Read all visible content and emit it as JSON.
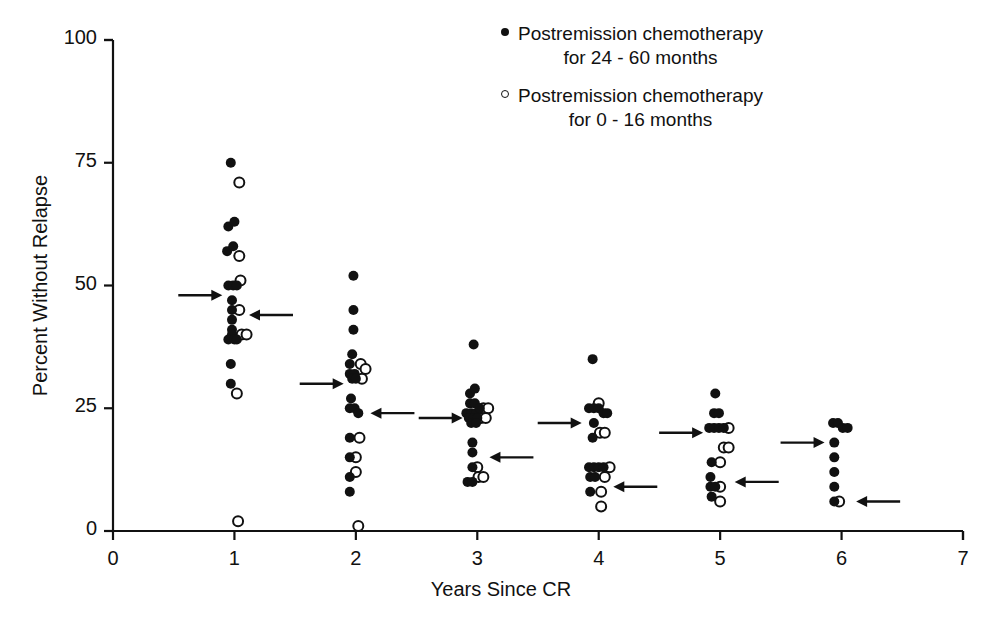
{
  "figure": {
    "title": "",
    "x_axis_label": "Years Since CR",
    "y_axis_label": "Percent Without Relapse",
    "legend": [
      {
        "marker": "filled-circle",
        "line1": "Postremission chemotherapy",
        "line2": "for 24 - 60 months"
      },
      {
        "marker": "open-circle",
        "line1": "Postremission chemotherapy",
        "line2": "for 0 - 16 months"
      }
    ],
    "colors": {
      "ink": "#111111",
      "background": "#ffffff"
    }
  },
  "chart_data": {
    "type": "scatter",
    "title": "",
    "xlabel": "Years Since CR",
    "ylabel": "Percent Without Relapse",
    "xlim": [
      0,
      7
    ],
    "ylim": [
      0,
      100
    ],
    "xticks": [
      0,
      1,
      2,
      3,
      4,
      5,
      6,
      7
    ],
    "yticks": [
      0,
      25,
      50,
      75,
      100
    ],
    "grid": false,
    "legend_position": "top-right",
    "series": [
      {
        "name": "Postremission chemotherapy for 24 - 60 months",
        "marker": "filled-circle",
        "points": [
          [
            0.97,
            75
          ],
          [
            0.95,
            62
          ],
          [
            1.0,
            63
          ],
          [
            0.94,
            57
          ],
          [
            0.99,
            58
          ],
          [
            0.95,
            50
          ],
          [
            0.99,
            50
          ],
          [
            1.02,
            50
          ],
          [
            0.98,
            47
          ],
          [
            0.98,
            45
          ],
          [
            0.98,
            43
          ],
          [
            0.98,
            41
          ],
          [
            0.98,
            40
          ],
          [
            0.95,
            39
          ],
          [
            1.0,
            39
          ],
          [
            1.02,
            39
          ],
          [
            0.97,
            34
          ],
          [
            0.97,
            30
          ],
          [
            1.98,
            52
          ],
          [
            1.98,
            45
          ],
          [
            1.98,
            41
          ],
          [
            1.97,
            36
          ],
          [
            1.95,
            34
          ],
          [
            1.95,
            32
          ],
          [
            1.99,
            32
          ],
          [
            1.97,
            31
          ],
          [
            2.0,
            31
          ],
          [
            1.96,
            27
          ],
          [
            1.95,
            25
          ],
          [
            1.99,
            25
          ],
          [
            2.02,
            24
          ],
          [
            1.95,
            19
          ],
          [
            1.95,
            15
          ],
          [
            1.95,
            11
          ],
          [
            1.95,
            8
          ],
          [
            2.97,
            38
          ],
          [
            2.94,
            28
          ],
          [
            2.98,
            29
          ],
          [
            2.94,
            26
          ],
          [
            2.98,
            26
          ],
          [
            2.91,
            24
          ],
          [
            2.95,
            24
          ],
          [
            2.99,
            24
          ],
          [
            3.02,
            25
          ],
          [
            2.93,
            23
          ],
          [
            2.97,
            23
          ],
          [
            3.0,
            23
          ],
          [
            2.95,
            22
          ],
          [
            2.99,
            22
          ],
          [
            2.96,
            18
          ],
          [
            2.96,
            16
          ],
          [
            2.96,
            13
          ],
          [
            2.92,
            10
          ],
          [
            2.96,
            10
          ],
          [
            3.95,
            35
          ],
          [
            3.92,
            25
          ],
          [
            3.96,
            25
          ],
          [
            4.0,
            25
          ],
          [
            4.04,
            24
          ],
          [
            4.07,
            24
          ],
          [
            3.96,
            22
          ],
          [
            3.95,
            19
          ],
          [
            3.92,
            13
          ],
          [
            3.96,
            13
          ],
          [
            4.0,
            13
          ],
          [
            4.04,
            13
          ],
          [
            3.93,
            11
          ],
          [
            3.97,
            11
          ],
          [
            3.93,
            8
          ],
          [
            4.96,
            28
          ],
          [
            4.95,
            24
          ],
          [
            4.99,
            24
          ],
          [
            4.91,
            21
          ],
          [
            4.95,
            21
          ],
          [
            4.99,
            21
          ],
          [
            5.03,
            21
          ],
          [
            4.93,
            14
          ],
          [
            4.92,
            11
          ],
          [
            4.92,
            9
          ],
          [
            4.96,
            9
          ],
          [
            4.93,
            7
          ],
          [
            5.93,
            22
          ],
          [
            5.97,
            22
          ],
          [
            6.01,
            21
          ],
          [
            6.05,
            21
          ],
          [
            5.94,
            18
          ],
          [
            5.94,
            15
          ],
          [
            5.94,
            12
          ],
          [
            5.94,
            9
          ],
          [
            5.94,
            6
          ]
        ]
      },
      {
        "name": "Postremission chemotherapy for 0 - 16 months",
        "marker": "open-circle",
        "points": [
          [
            1.04,
            71
          ],
          [
            1.04,
            56
          ],
          [
            1.05,
            51
          ],
          [
            1.04,
            45
          ],
          [
            1.06,
            40
          ],
          [
            1.1,
            40
          ],
          [
            1.02,
            28
          ],
          [
            1.03,
            2
          ],
          [
            2.04,
            34
          ],
          [
            2.08,
            33
          ],
          [
            2.05,
            31
          ],
          [
            2.03,
            19
          ],
          [
            2.0,
            15
          ],
          [
            2.0,
            12
          ],
          [
            2.02,
            1
          ],
          [
            3.05,
            25
          ],
          [
            3.09,
            25
          ],
          [
            3.03,
            23
          ],
          [
            3.07,
            23
          ],
          [
            3.0,
            13
          ],
          [
            3.01,
            11
          ],
          [
            3.05,
            11
          ],
          [
            4.0,
            26
          ],
          [
            4.01,
            20
          ],
          [
            4.05,
            20
          ],
          [
            4.09,
            13
          ],
          [
            4.05,
            11
          ],
          [
            4.02,
            8
          ],
          [
            4.02,
            5
          ],
          [
            5.07,
            21
          ],
          [
            5.03,
            17
          ],
          [
            5.07,
            17
          ],
          [
            5.0,
            14
          ],
          [
            5.0,
            9
          ],
          [
            5.0,
            6
          ],
          [
            5.98,
            6
          ]
        ]
      }
    ],
    "annotations": [
      {
        "type": "arrow-right",
        "label": "",
        "tip_x": 0.9,
        "y": 48
      },
      {
        "type": "arrow-left",
        "label": "",
        "tip_x": 1.12,
        "y": 44
      },
      {
        "type": "arrow-right",
        "label": "",
        "tip_x": 1.9,
        "y": 30
      },
      {
        "type": "arrow-left",
        "label": "",
        "tip_x": 2.12,
        "y": 24
      },
      {
        "type": "arrow-right",
        "label": "",
        "tip_x": 2.88,
        "y": 23
      },
      {
        "type": "arrow-left",
        "label": "",
        "tip_x": 3.1,
        "y": 15
      },
      {
        "type": "arrow-right",
        "label": "",
        "tip_x": 3.86,
        "y": 22
      },
      {
        "type": "arrow-left",
        "label": "",
        "tip_x": 4.12,
        "y": 9
      },
      {
        "type": "arrow-right",
        "label": "",
        "tip_x": 4.86,
        "y": 20
      },
      {
        "type": "arrow-left",
        "label": "",
        "tip_x": 5.12,
        "y": 10
      },
      {
        "type": "arrow-right",
        "label": "",
        "tip_x": 5.86,
        "y": 18
      },
      {
        "type": "arrow-left",
        "label": "",
        "tip_x": 6.12,
        "y": 6
      }
    ]
  },
  "ticks": {
    "y": [
      "100",
      "75",
      "50",
      "25",
      "0"
    ],
    "x": [
      "0",
      "1",
      "2",
      "3",
      "4",
      "5",
      "6",
      "7"
    ]
  }
}
